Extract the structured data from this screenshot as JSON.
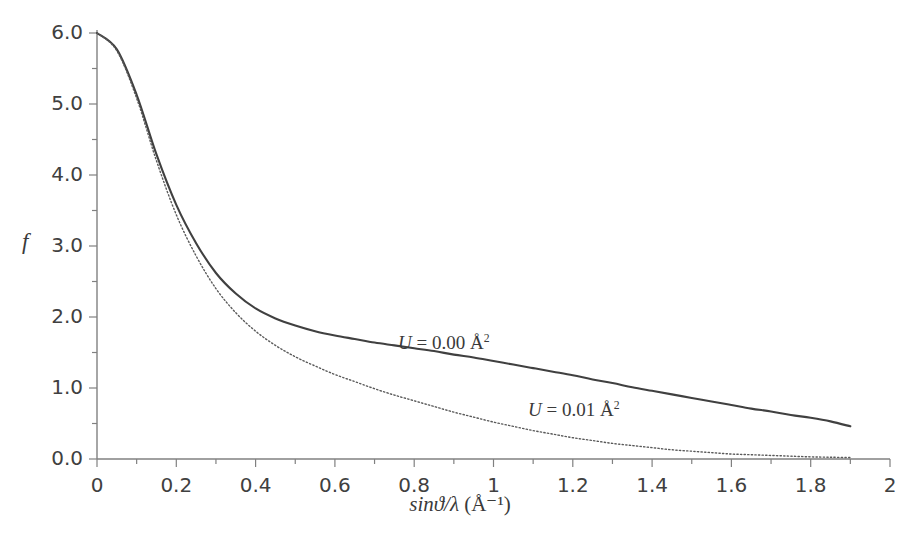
{
  "chart_data": {
    "type": "line",
    "title": "",
    "xlabel": "sinϑ/λ (Å⁻¹)",
    "ylabel": "f",
    "xlim": [
      0,
      2
    ],
    "ylim": [
      0,
      6
    ],
    "xticks": [
      0,
      0.2,
      0.4,
      0.6,
      0.8,
      1,
      1.2,
      1.4,
      1.6,
      1.8,
      2
    ],
    "xticklabels": [
      "0",
      "0.2",
      "0.4",
      "0.6",
      "0.8",
      "1",
      "1.2",
      "1.4",
      "1.6",
      "1.8",
      "2"
    ],
    "xminor_step": 0.1,
    "yticks": [
      0,
      1,
      2,
      3,
      4,
      5,
      6
    ],
    "yticklabels": [
      "0.0",
      "1.0",
      "2.0",
      "3.0",
      "4.0",
      "5.0",
      "6.0"
    ],
    "yminor_step": 0.5,
    "grid": false,
    "legend_position": "inline-annotations",
    "axis_color": "#808080",
    "series": [
      {
        "name": "U = 0.00 Å²",
        "style": "solid",
        "color": "#404040",
        "width": 2.1,
        "x": [
          0,
          0.05,
          0.1,
          0.15,
          0.2,
          0.25,
          0.3,
          0.35,
          0.4,
          0.45,
          0.5,
          0.55,
          0.6,
          0.65,
          0.7,
          0.75,
          0.8,
          0.85,
          0.9,
          0.95,
          1.0,
          1.05,
          1.1,
          1.15,
          1.2,
          1.25,
          1.3,
          1.35,
          1.4,
          1.45,
          1.5,
          1.55,
          1.6,
          1.65,
          1.7,
          1.75,
          1.8,
          1.85,
          1.9
        ],
        "y": [
          6.0,
          5.77,
          5.13,
          4.29,
          3.58,
          3.04,
          2.62,
          2.33,
          2.12,
          1.98,
          1.88,
          1.8,
          1.74,
          1.69,
          1.64,
          1.6,
          1.56,
          1.52,
          1.47,
          1.43,
          1.38,
          1.33,
          1.28,
          1.23,
          1.18,
          1.12,
          1.07,
          1.01,
          0.96,
          0.91,
          0.86,
          0.81,
          0.76,
          0.71,
          0.67,
          0.62,
          0.58,
          0.53,
          0.46
        ]
      },
      {
        "name": "U = 0.01 Å²",
        "style": "dotted",
        "color": "#5a5a5a",
        "width": 1.4,
        "x": [
          0,
          0.05,
          0.1,
          0.15,
          0.2,
          0.25,
          0.3,
          0.35,
          0.4,
          0.45,
          0.5,
          0.55,
          0.6,
          0.65,
          0.7,
          0.75,
          0.8,
          0.85,
          0.9,
          0.95,
          1.0,
          1.05,
          1.1,
          1.15,
          1.2,
          1.25,
          1.3,
          1.35,
          1.4,
          1.45,
          1.5,
          1.55,
          1.6,
          1.65,
          1.7,
          1.75,
          1.8,
          1.85,
          1.9
        ],
        "y": [
          6.0,
          5.75,
          5.08,
          4.2,
          3.44,
          2.86,
          2.4,
          2.06,
          1.8,
          1.6,
          1.44,
          1.31,
          1.19,
          1.09,
          0.99,
          0.9,
          0.82,
          0.74,
          0.66,
          0.59,
          0.52,
          0.46,
          0.4,
          0.35,
          0.3,
          0.26,
          0.22,
          0.19,
          0.16,
          0.13,
          0.11,
          0.09,
          0.07,
          0.06,
          0.05,
          0.04,
          0.03,
          0.025,
          0.02
        ]
      }
    ],
    "annotations": [
      {
        "text": "U = 0.00 Å²",
        "var": "U",
        "rest": " = 0.00 Å",
        "sup": "2",
        "x_px": 398,
        "y_px": 332
      },
      {
        "text": "U = 0.01 Å²",
        "var": "U",
        "rest": " = 0.01 Å",
        "sup": "2",
        "x_px": 528,
        "y_px": 399
      }
    ]
  },
  "axes": {
    "y_title": "f",
    "x_title_main": "sinϑ/λ",
    "x_title_unit": " (Å⁻¹)"
  }
}
